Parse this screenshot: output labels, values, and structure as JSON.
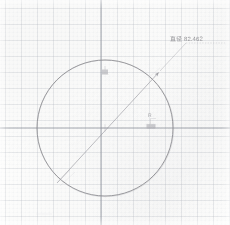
{
  "figure": {
    "kind": "engineering-sketch",
    "medium": "graph-paper-scan",
    "width_px": 230,
    "height_px": 225
  },
  "colors": {
    "paper": "#fdfdfc",
    "grid_minor": "#d6d9de",
    "grid_major": "#a9aeb6",
    "geometry_stroke": "#8b8b90",
    "dimension_stroke": "#9a9aa0",
    "label_text": "#8f8f93"
  },
  "grid": {
    "minor_spacing_px": 4,
    "major_spacing_px": 16,
    "minor_style": "dotted",
    "major_style": "solid",
    "visible": true,
    "vertical_major_x": [
      5,
      21,
      37,
      53,
      69,
      85,
      101,
      117,
      133,
      149,
      165,
      181,
      197,
      213,
      229
    ],
    "horizontal_major_y": [
      8,
      24,
      40,
      56,
      72,
      88,
      104,
      120,
      136,
      152,
      168,
      184,
      200,
      216
    ]
  },
  "axes": {
    "horizontal_axis_y": 128,
    "vertical_axis_x": 101,
    "emphasized": true
  },
  "geometry": {
    "circle": {
      "label": "circle",
      "center_x": 105,
      "center_y": 128,
      "radius_px": 68,
      "left_px": 37,
      "right_px": 173,
      "top_px": 60,
      "bottom_px": 196,
      "stroke_width": 0.9
    },
    "diameter_line": {
      "label": "diameter-dimension-line",
      "x1": 57,
      "y1": 183,
      "x2": 161,
      "y2": 70,
      "stroke_width": 0.7,
      "arrowheads": [
        "end"
      ]
    },
    "leader_extension": {
      "label": "leader-extension",
      "x1": 161,
      "y1": 70,
      "x2": 186,
      "y2": 43
    },
    "leader_shelf": {
      "label": "leader-shelf",
      "x1": 186,
      "y1": 43,
      "x2": 224,
      "y2": 43
    },
    "center_mark": {
      "label": "center-mark",
      "x": 105,
      "y": 128,
      "size_px": 3
    },
    "top_tick_mark": {
      "label": "upper-arc-tick",
      "x": 105,
      "y": 72,
      "width_px": 6,
      "height_px": 5
    },
    "right_tick_mark": {
      "label": "right-axis-tick",
      "x": 150,
      "y": 126,
      "width_px": 9,
      "height_px": 5
    }
  },
  "annotations": {
    "diameter_label": "直径 82.462",
    "radius_tick_label": "R"
  },
  "measurements": {
    "diameter_value": 82.462,
    "diameter_units": "mm",
    "radius_value": 41.231
  }
}
